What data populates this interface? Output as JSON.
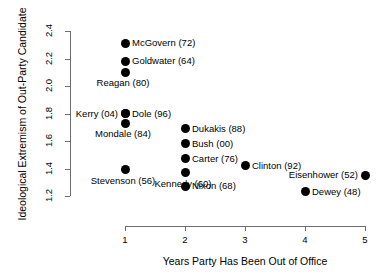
{
  "chart_data": {
    "type": "scatter",
    "title": "",
    "xlabel": "Years Party Has Been Out of Office",
    "ylabel": "Ideological Extremism of Out-Party Candidate",
    "xlim": [
      0.6,
      5.4
    ],
    "ylim": [
      1.15,
      2.45
    ],
    "xticks": [
      "1",
      "2",
      "3",
      "4",
      "5"
    ],
    "xtick_values": [
      1,
      2,
      3,
      4,
      5
    ],
    "yticks": [
      "1.2",
      "1.4",
      "1.6",
      "1.8",
      "2.0",
      "2.2",
      "2.4"
    ],
    "ytick_values": [
      1.2,
      1.4,
      1.6,
      1.8,
      2.0,
      2.2,
      2.4
    ],
    "grid": false,
    "legend": "none",
    "marker_color": "#000000",
    "axis_color": "#6e6e6e",
    "points": [
      {
        "label": "McGovern (72)",
        "x": 1,
        "y": 2.31,
        "place": "right"
      },
      {
        "label": "Goldwater (64)",
        "x": 1,
        "y": 2.18,
        "place": "right"
      },
      {
        "label": "Reagan (80)",
        "x": 1,
        "y": 2.1,
        "place": "below-left"
      },
      {
        "label": "Dole (96)",
        "x": 1,
        "y": 1.8,
        "place": "right"
      },
      {
        "label": "Kerry (04)",
        "x": 1,
        "y": 1.8,
        "place": "left"
      },
      {
        "label": "Mondale (84)",
        "x": 1,
        "y": 1.73,
        "place": "below-left"
      },
      {
        "label": "Stevenson (56)",
        "x": 1,
        "y": 1.39,
        "place": "below-left"
      },
      {
        "label": "Dukakis (88)",
        "x": 2,
        "y": 1.69,
        "place": "right"
      },
      {
        "label": "Bush (00)",
        "x": 2,
        "y": 1.58,
        "place": "right"
      },
      {
        "label": "Carter (76)",
        "x": 2,
        "y": 1.47,
        "place": "right"
      },
      {
        "label": "Kennedy (60)",
        "x": 2,
        "y": 1.37,
        "place": "below-left"
      },
      {
        "label": "Nixon (68)",
        "x": 2,
        "y": 1.27,
        "place": "right"
      },
      {
        "label": "Clinton (92)",
        "x": 3,
        "y": 1.42,
        "place": "right"
      },
      {
        "label": "Dewey (48)",
        "x": 4,
        "y": 1.23,
        "place": "right"
      },
      {
        "label": "Eisenhower (52)",
        "x": 5,
        "y": 1.35,
        "place": "left"
      }
    ]
  }
}
